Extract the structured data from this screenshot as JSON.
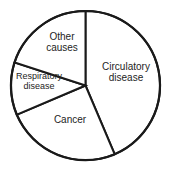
{
  "chart_data": {
    "type": "pie",
    "title": "",
    "subtitle": "",
    "xlabel": "",
    "ylabel": "",
    "legend_position": "none",
    "grid": false,
    "labels_inside_slices": true,
    "start_angle_deg": 0,
    "direction": "clockwise",
    "categories": [
      "Circulatory disease",
      "Cancer",
      "Respiratory disease",
      "Other causes"
    ],
    "values": [
      44,
      25,
      11,
      20
    ],
    "slices": [
      {
        "name": "circulatory-disease",
        "label_lines": [
          "Circulatory",
          "disease"
        ],
        "value": 44,
        "start_angle_deg": 0,
        "end_angle_deg": 157,
        "sweep_deg": 157,
        "fill": "#ffffff",
        "stroke": "#1a1a1a"
      },
      {
        "name": "cancer",
        "label_lines": [
          "Cancer"
        ],
        "value": 25,
        "start_angle_deg": 157,
        "end_angle_deg": 247,
        "sweep_deg": 90,
        "fill": "#ffffff",
        "stroke": "#1a1a1a"
      },
      {
        "name": "respiratory-disease",
        "label_lines": [
          "Respiratory",
          "disease"
        ],
        "value": 11,
        "start_angle_deg": 247,
        "end_angle_deg": 288,
        "sweep_deg": 41,
        "fill": "#ffffff",
        "stroke": "#1a1a1a"
      },
      {
        "name": "other-causes",
        "label_lines": [
          "Other",
          "causes"
        ],
        "value": 20,
        "start_angle_deg": 288,
        "end_angle_deg": 360,
        "sweep_deg": 72,
        "fill": "#ffffff",
        "stroke": "#1a1a1a"
      }
    ],
    "geometry": {
      "center_x": 85.5,
      "center_y": 85.5,
      "radius": 74.5
    },
    "colors": {
      "background": "#ffffff",
      "outline": "#1a1a1a",
      "text": "#242424"
    }
  },
  "labels": {
    "circulatory_line1": "Circulatory",
    "circulatory_line2": "disease",
    "other_line1": "Other",
    "other_line2": "causes",
    "respiratory_line1": "Respiratory",
    "respiratory_line2": "disease",
    "cancer_line1": "Cancer"
  }
}
